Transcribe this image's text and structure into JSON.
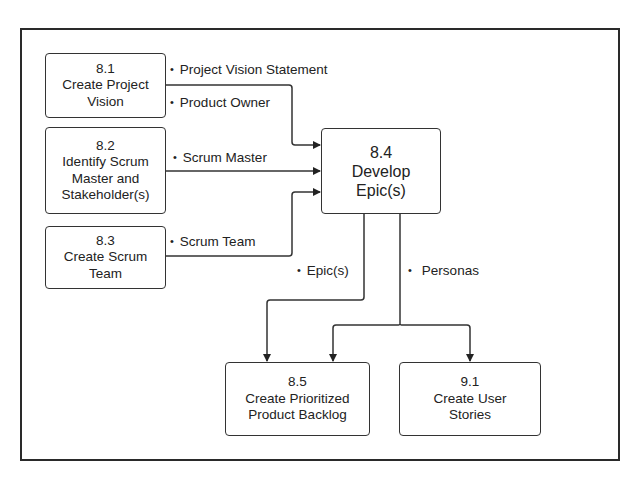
{
  "diagram": {
    "title": "",
    "boxes": {
      "create_project_vision": {
        "number": "8.1",
        "lines": [
          "Create Project",
          "Vision"
        ]
      },
      "identify_scrum_master": {
        "number": "8.2",
        "lines": [
          "Identify Scrum",
          "Master and",
          "Stakeholder(s)"
        ]
      },
      "create_scrum_team": {
        "number": "8.3",
        "lines": [
          "Create Scrum",
          "Team"
        ]
      },
      "develop_epics": {
        "number": "8.4",
        "lines": [
          "Develop",
          "Epic(s)"
        ]
      },
      "create_prioritized_backlog": {
        "number": "8.5",
        "lines": [
          "Create Prioritized",
          "Product Backlog"
        ]
      },
      "create_user_stories": {
        "number": "9.1",
        "lines": [
          "Create User",
          "Stories"
        ]
      }
    },
    "labels": {
      "project_vision_statement": "Project Vision Statement",
      "product_owner": "Product Owner",
      "scrum_master": "Scrum Master",
      "scrum_team": "Scrum Team",
      "epics": "Epic(s)",
      "personas": "Personas"
    },
    "bullet": "•",
    "colors": {
      "line": "#333333",
      "frame": "#2a2a2a",
      "background": "#ffffff"
    }
  }
}
